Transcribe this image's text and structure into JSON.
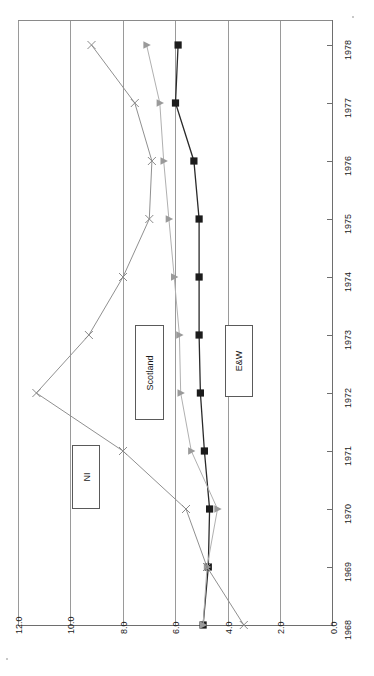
{
  "chart_data": {
    "type": "line",
    "title": "",
    "subtitle": "",
    "orientation": "rotated-90",
    "xlabel": "",
    "ylabel": "",
    "x": [
      1968,
      1969,
      1970,
      1971,
      1972,
      1973,
      1974,
      1975,
      1976,
      1977,
      1978
    ],
    "x_tick_labels": [
      "1968",
      "1969",
      "1970",
      "1971",
      "1972",
      "1973",
      "1974",
      "1975",
      "1976",
      "1977",
      "1978"
    ],
    "y_tick_labels": [
      "0.0",
      "2.0",
      "4.0",
      "6.0",
      "8.0",
      "10.0",
      "12.0"
    ],
    "y_ticks": [
      0.0,
      2.0,
      4.0,
      6.0,
      8.0,
      10.0,
      12.0
    ],
    "ylim": [
      0.0,
      12.0
    ],
    "grid": true,
    "grid_axis": "value",
    "legend_position": "inside-plot",
    "series": [
      {
        "name": "E&W",
        "marker": "square",
        "color": "#1c1c1c",
        "line_color": "#2a2a2a",
        "values": [
          4.95,
          4.75,
          4.7,
          4.9,
          5.05,
          5.1,
          5.1,
          5.1,
          5.3,
          6.0,
          5.9
        ]
      },
      {
        "name": "Scotland",
        "marker": "triangle",
        "color": "#9a9a9a",
        "line_color": "#b0b0b0",
        "values": [
          4.95,
          4.8,
          4.4,
          5.4,
          5.8,
          5.85,
          6.05,
          6.25,
          6.45,
          6.6,
          7.1
        ]
      },
      {
        "name": "NI",
        "marker": "x",
        "color": "#8a8a8a",
        "line_color": "#909090",
        "values": [
          3.4,
          4.8,
          5.6,
          8.0,
          11.3,
          9.3,
          8.0,
          7.0,
          6.9,
          7.55,
          9.2
        ]
      }
    ],
    "legend_labels": [
      "NI",
      "Scotland",
      "E&W"
    ]
  },
  "legend": {
    "ni": "NI",
    "scotland": "Scotland",
    "ew": "E&W"
  }
}
